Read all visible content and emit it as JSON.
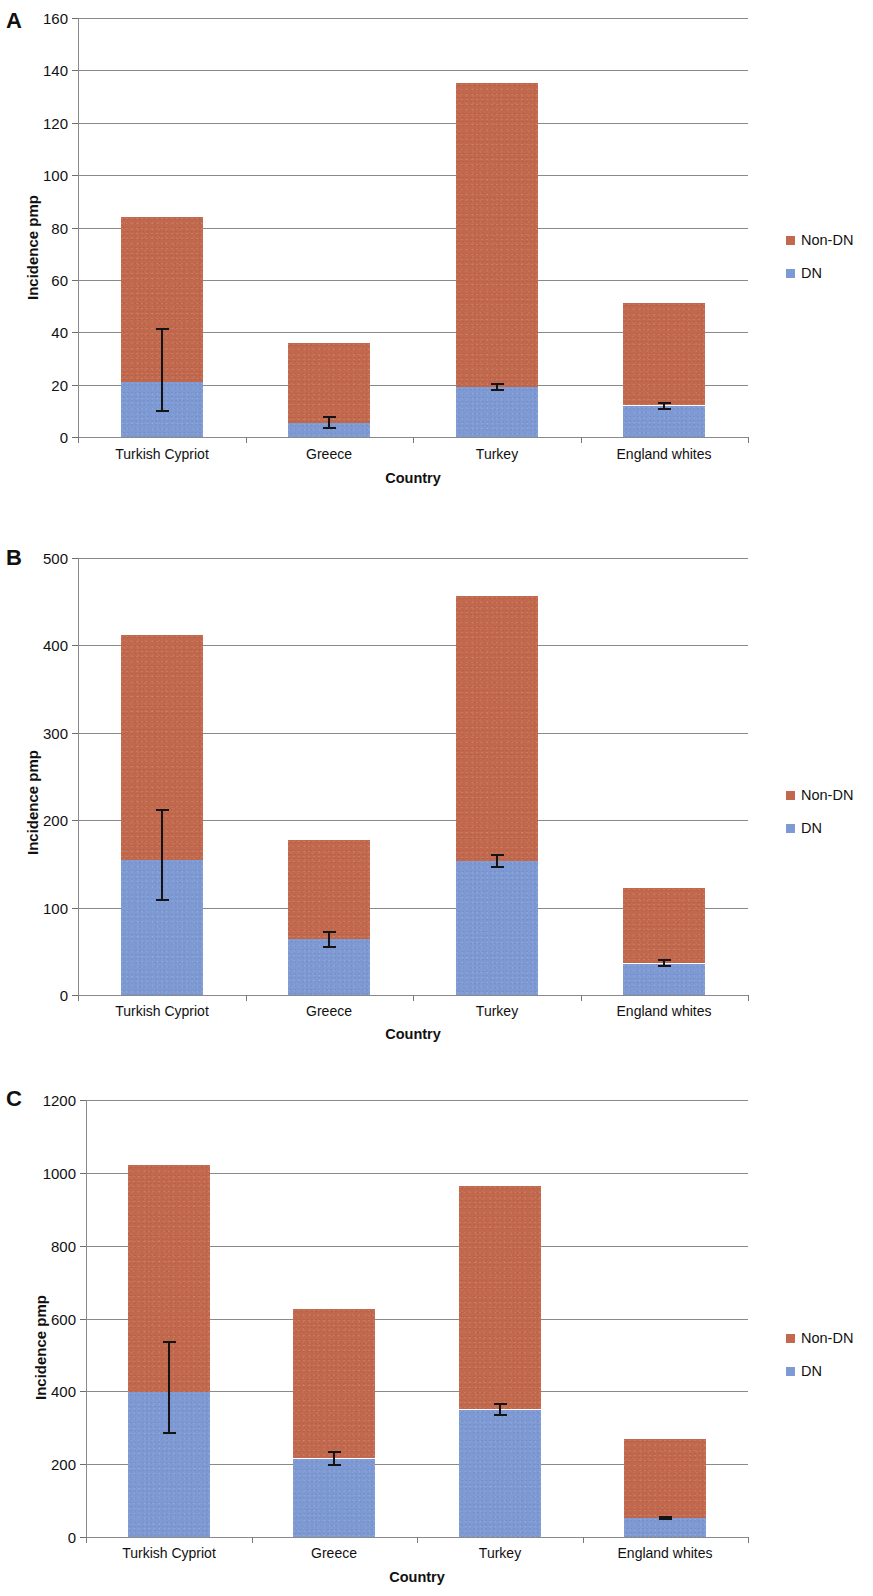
{
  "figure": {
    "panels": [
      "A",
      "B",
      "C"
    ],
    "series_colors": {
      "non_dn": "#c2684c",
      "dn": "#7e9ad4"
    },
    "legend_labels": {
      "non_dn": "Non-DN",
      "dn": "DN"
    }
  },
  "panelA": {
    "letter": "A",
    "xlabel": "Country",
    "ylabel": "Incidence pmp",
    "yticks": [
      "0",
      "20",
      "40",
      "60",
      "80",
      "100",
      "120",
      "140",
      "160"
    ],
    "categories": [
      "Turkish Cypriot",
      "Greece",
      "Turkey",
      "England whites"
    ],
    "legend": [
      "Non-DN",
      "DN"
    ]
  },
  "panelB": {
    "letter": "B",
    "xlabel": "Country",
    "ylabel": "Incidence pmp",
    "yticks": [
      "0",
      "100",
      "200",
      "300",
      "400",
      "500"
    ],
    "categories": [
      "Turkish Cypriot",
      "Greece",
      "Turkey",
      "England whites"
    ],
    "legend": [
      "Non-DN",
      "DN"
    ]
  },
  "panelC": {
    "letter": "C",
    "xlabel": "Country",
    "ylabel": "Incidence pmp",
    "yticks": [
      "0",
      "200",
      "400",
      "600",
      "800",
      "1000",
      "1200"
    ],
    "categories": [
      "Turkish Cypriot",
      "Greece",
      "Turkey",
      "England whites"
    ],
    "legend": [
      "Non-DN",
      "DN"
    ]
  },
  "chart_data": [
    {
      "panel": "A",
      "type": "bar",
      "stacked": true,
      "title": "",
      "xlabel": "Country",
      "ylabel": "Incidence pmp",
      "ylim": [
        0,
        160
      ],
      "ytick_values": [
        0,
        20,
        40,
        60,
        80,
        100,
        120,
        140,
        160
      ],
      "grid": true,
      "legend_position": "right",
      "categories": [
        "Turkish Cypriot",
        "Greece",
        "Turkey",
        "England whites"
      ],
      "series": [
        {
          "name": "DN",
          "color": "#7e9ad4",
          "values": [
            21,
            5.5,
            19,
            12
          ]
        },
        {
          "name": "Non-DN",
          "color": "#c2684c",
          "values": [
            63,
            30.5,
            116,
            39
          ]
        }
      ],
      "totals": [
        84,
        36,
        135,
        51
      ],
      "error_bars": {
        "applies_to": "DN",
        "lower": [
          9.5,
          3,
          17.5,
          10.5
        ],
        "upper": [
          41.5,
          8,
          20.5,
          13.5
        ]
      }
    },
    {
      "panel": "B",
      "type": "bar",
      "stacked": true,
      "title": "",
      "xlabel": "Country",
      "ylabel": "Incidence pmp",
      "ylim": [
        0,
        500
      ],
      "ytick_values": [
        0,
        100,
        200,
        300,
        400,
        500
      ],
      "grid": true,
      "legend_position": "right",
      "categories": [
        "Turkish Cypriot",
        "Greece",
        "Turkey",
        "England whites"
      ],
      "series": [
        {
          "name": "DN",
          "color": "#7e9ad4",
          "values": [
            155,
            64,
            153,
            36
          ]
        },
        {
          "name": "Non-DN",
          "color": "#c2684c",
          "values": [
            257,
            113,
            304,
            86
          ]
        }
      ],
      "totals": [
        412,
        177,
        457,
        122
      ],
      "error_bars": {
        "applies_to": "DN",
        "lower": [
          108,
          54,
          145,
          32
        ],
        "upper": [
          213,
          73,
          161,
          41
        ]
      }
    },
    {
      "panel": "C",
      "type": "bar",
      "stacked": true,
      "title": "",
      "xlabel": "Country",
      "ylabel": "Incidence pmp",
      "ylim": [
        0,
        1200
      ],
      "ytick_values": [
        0,
        200,
        400,
        600,
        800,
        1000,
        1200
      ],
      "grid": true,
      "legend_position": "right",
      "categories": [
        "Turkish Cypriot",
        "Greece",
        "Turkey",
        "England whites"
      ],
      "series": [
        {
          "name": "DN",
          "color": "#7e9ad4",
          "values": [
            398,
            215,
            350,
            52
          ]
        },
        {
          "name": "Non-DN",
          "color": "#c2684c",
          "values": [
            624,
            410,
            613,
            218
          ]
        }
      ],
      "totals": [
        1022,
        625,
        963,
        270
      ],
      "error_bars": {
        "applies_to": "DN",
        "lower": [
          282,
          194,
          332,
          46
        ],
        "upper": [
          538,
          236,
          368,
          58
        ]
      }
    }
  ]
}
